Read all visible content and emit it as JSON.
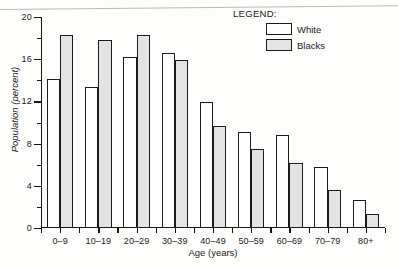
{
  "chart_data": {
    "type": "bar",
    "title": "",
    "xlabel": "Age (years)",
    "ylabel": "Population (percent)",
    "categories": [
      "0–9",
      "10–19",
      "20–29",
      "30–39",
      "40–49",
      "50–59",
      "60–69",
      "70–79",
      "80+"
    ],
    "series": [
      {
        "name": "White",
        "color": "#ffffff",
        "values": [
          14.1,
          13.4,
          16.2,
          16.6,
          11.9,
          9.1,
          8.8,
          5.8,
          2.7
        ]
      },
      {
        "name": "Blacks",
        "color": "#e3e3e3",
        "values": [
          18.3,
          17.8,
          18.3,
          15.9,
          9.7,
          7.5,
          6.2,
          3.6,
          1.3
        ]
      }
    ],
    "ylim": [
      0,
      20
    ],
    "y_major_ticks": [
      0,
      4,
      8,
      12,
      16,
      20
    ],
    "y_minor_ticks": [
      2,
      6,
      10,
      14,
      18
    ],
    "y_tick_labels": [
      "0",
      "4",
      "8",
      "12",
      "16",
      "20"
    ],
    "grid": false,
    "legend_position": "top-right"
  },
  "legend": {
    "title": "LEGEND:",
    "entries": [
      {
        "label": "White",
        "swatch": "white-swatch"
      },
      {
        "label": "Blacks",
        "swatch": "blacks-swatch"
      }
    ]
  }
}
